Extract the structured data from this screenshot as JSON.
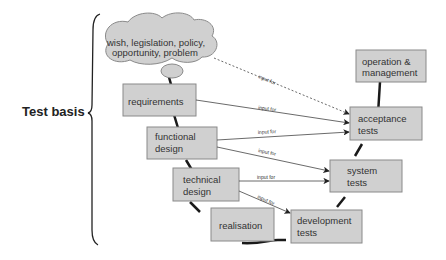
{
  "title": "Test basis",
  "cloud": {
    "line1": "wish, legislation, policy,",
    "line2": "opportunity, problem"
  },
  "left_boxes": [
    {
      "id": "requirements",
      "lines": [
        "requirements"
      ]
    },
    {
      "id": "functional-design",
      "lines": [
        "functional",
        "design"
      ]
    },
    {
      "id": "technical-design",
      "lines": [
        "technical",
        "design"
      ]
    },
    {
      "id": "realisation",
      "lines": [
        "realisation"
      ]
    }
  ],
  "right_boxes": [
    {
      "id": "operation-management",
      "lines": [
        "operation &",
        "management"
      ]
    },
    {
      "id": "acceptance-tests",
      "lines": [
        "acceptance",
        "tests"
      ]
    },
    {
      "id": "system-tests",
      "lines": [
        "system",
        "tests"
      ]
    },
    {
      "id": "development-tests",
      "lines": [
        "development",
        "tests"
      ]
    }
  ],
  "arrow_label": "input for",
  "colors": {
    "box_fill": "#d0d0d0",
    "box_stroke": "#8a8a8a",
    "line": "#1a1a1a"
  }
}
